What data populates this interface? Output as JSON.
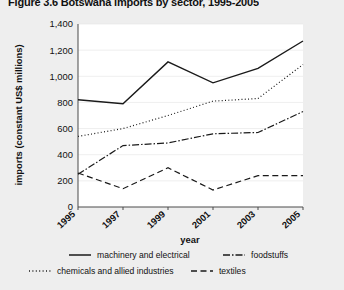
{
  "title": "Figure 3.6 Botswana imports by sector, 1995-2005",
  "chart_data": {
    "type": "line",
    "title": "Figure 3.6 Botswana imports by sector, 1995-2005",
    "xlabel": "year",
    "ylabel": "imports (constant US$ millions)",
    "categories": [
      "1995",
      "1997",
      "1999",
      "2001",
      "2003",
      "2005"
    ],
    "x_tick_labels": [
      "1995",
      "1997",
      "1999",
      "2001",
      "2003",
      "2005"
    ],
    "y_tick_labels": [
      "0",
      "200",
      "400",
      "600",
      "800",
      "1,000",
      "1,200",
      "1,400"
    ],
    "y_ticks": [
      0,
      200,
      400,
      600,
      800,
      1000,
      1200,
      1400
    ],
    "ylim": [
      0,
      1400
    ],
    "grid": true,
    "legend_position": "bottom",
    "series": [
      {
        "name": "machinery and electrical",
        "style": "solid",
        "values": [
          820,
          790,
          1110,
          950,
          1060,
          1270
        ]
      },
      {
        "name": "chemicals and allied industries",
        "style": "dotted",
        "values": [
          540,
          600,
          700,
          810,
          830,
          1090
        ]
      },
      {
        "name": "foodstuffs",
        "style": "dash-dot",
        "values": [
          250,
          470,
          490,
          560,
          570,
          730
        ]
      },
      {
        "name": "textiles",
        "style": "dashed",
        "values": [
          260,
          140,
          300,
          130,
          240,
          240
        ]
      }
    ]
  },
  "legend": {
    "items": [
      {
        "label": "machinery and electrical",
        "style": "solid"
      },
      {
        "label": "chemicals and allied industries",
        "style": "dotted"
      },
      {
        "label": "foodstuffs",
        "style": "dash-dot"
      },
      {
        "label": "textiles",
        "style": "dashed"
      }
    ]
  },
  "colors": {
    "background": "#eeeeee",
    "plot_background": "#ffffff",
    "line": "#1a1a1a",
    "grid": "#e3e3e3"
  }
}
